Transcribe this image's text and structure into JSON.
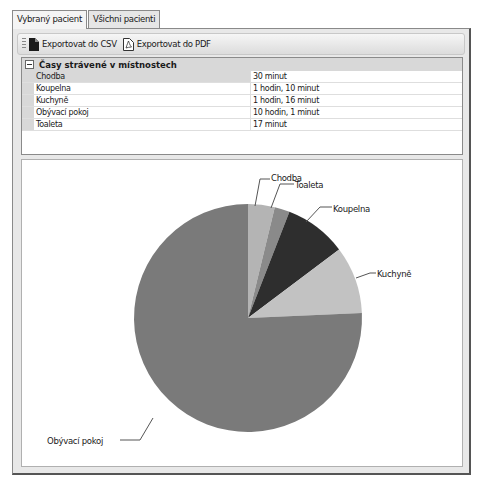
{
  "tabs": [
    {
      "label": "Vybraný pacient",
      "active": true
    },
    {
      "label": "Všichni pacienti",
      "active": false
    }
  ],
  "toolbar": {
    "export_csv_label": "Exportovat do CSV",
    "export_pdf_label": "Exportovat do PDF",
    "export_csv_icon": "csv-document-icon",
    "export_pdf_icon": "pdf-document-icon"
  },
  "properties": {
    "category_title": "Časy strávené v místnostech",
    "rows": [
      {
        "name": "Chodba",
        "value": "30 minut"
      },
      {
        "name": "Koupelna",
        "value": "1 hodin, 10 minut"
      },
      {
        "name": "Kuchyně",
        "value": "1 hodin, 16 minut"
      },
      {
        "name": "Obývací pokoj",
        "value": "10 hodin, 1 minut"
      },
      {
        "name": "Toaleta",
        "value": "17 minut"
      }
    ]
  },
  "chart_data": {
    "type": "pie",
    "title": "",
    "unit": "minutes",
    "start_angle": "12 o'clock, clockwise",
    "categories": [
      "Chodba",
      "Toaleta",
      "Koupelna",
      "Kuchyně",
      "Obývací pokoj"
    ],
    "values": [
      30,
      17,
      70,
      76,
      601
    ],
    "colors": [
      "#b4b4b4",
      "#8a8a8a",
      "#2e2e2e",
      "#c2c2c2",
      "#7a7a7a"
    ],
    "legend": "none (leader-line labels)"
  }
}
